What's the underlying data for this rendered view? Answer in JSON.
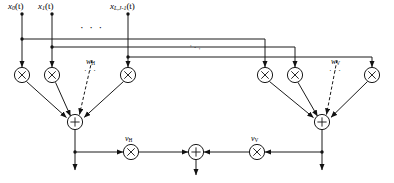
{
  "figure": {
    "type": "signal-flow-diagram",
    "stroke_color": "#1a1a1a",
    "accent_color": "#000000",
    "background": "#ffffff"
  },
  "inputs": [
    {
      "id": "x0",
      "base": "x",
      "sub": "0",
      "arg": "(t)",
      "x": 22,
      "label": "x0(t)"
    },
    {
      "id": "x1",
      "base": "x",
      "sub": "1",
      "arg": "(t)",
      "x": 52,
      "label": "x1(t)"
    },
    {
      "id": "xLJ1",
      "base": "x",
      "sub": "L,J-1",
      "arg": "(t)",
      "x": 128,
      "label": "xL,J-1(t)"
    }
  ],
  "weights": {
    "horizontal": {
      "base": "w",
      "sub": "H",
      "label": "wH"
    },
    "vertical": {
      "base": "w",
      "sub": "V",
      "label": "wV"
    }
  },
  "gains": {
    "horizontal": {
      "base": "v",
      "sub": "H",
      "label": "vH"
    },
    "vertical": {
      "base": "v",
      "sub": "V",
      "label": "vV"
    }
  },
  "ellipses": {
    "top_row": "· · ·",
    "bus_diagonal": "· · ·",
    "left_weight_row": "· · ·",
    "right_weight_row": "· · ·"
  },
  "nodes": {
    "multiplier_glyph": "×",
    "summation_glyph": "+",
    "left_multipliers": [
      {
        "x": 22,
        "y": 75
      },
      {
        "x": 52,
        "y": 75
      },
      {
        "x": 128,
        "y": 75
      }
    ],
    "right_multipliers": [
      {
        "x": 265,
        "y": 75
      },
      {
        "x": 295,
        "y": 75
      },
      {
        "x": 372,
        "y": 75
      }
    ],
    "left_sum": {
      "x": 75,
      "y": 122
    },
    "right_sum": {
      "x": 322,
      "y": 122
    },
    "center_sum": {
      "x": 196,
      "y": 152
    },
    "gain_h": {
      "x": 131,
      "y": 152
    },
    "gain_v": {
      "x": 257,
      "y": 152
    }
  }
}
